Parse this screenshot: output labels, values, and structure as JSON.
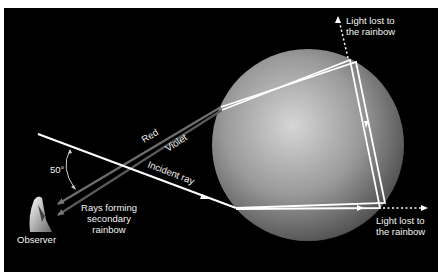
{
  "diagram": {
    "colors": {
      "background": "#000000",
      "page": "#ffffff",
      "ray": "#ffffff",
      "red_ray": "#6e6e6e",
      "violet_ray": "#5a5a5a",
      "drop_highlight": "#d8d8d8",
      "drop_shadow": "#3a3a3a"
    },
    "labels": {
      "light_lost_top_line1": "Light lost to",
      "light_lost_top_line2": "the rainbow",
      "light_lost_right_line1": "Light lost to",
      "light_lost_right_line2": "the rainbow",
      "red": "Red",
      "violet": "Violet",
      "incident_ray": "Incident ray",
      "angle": "50°",
      "rays_forming_line1": "Rays forming",
      "rays_forming_line2": "secondary",
      "rays_forming_line3": "rainbow",
      "observer": "Observer"
    }
  }
}
